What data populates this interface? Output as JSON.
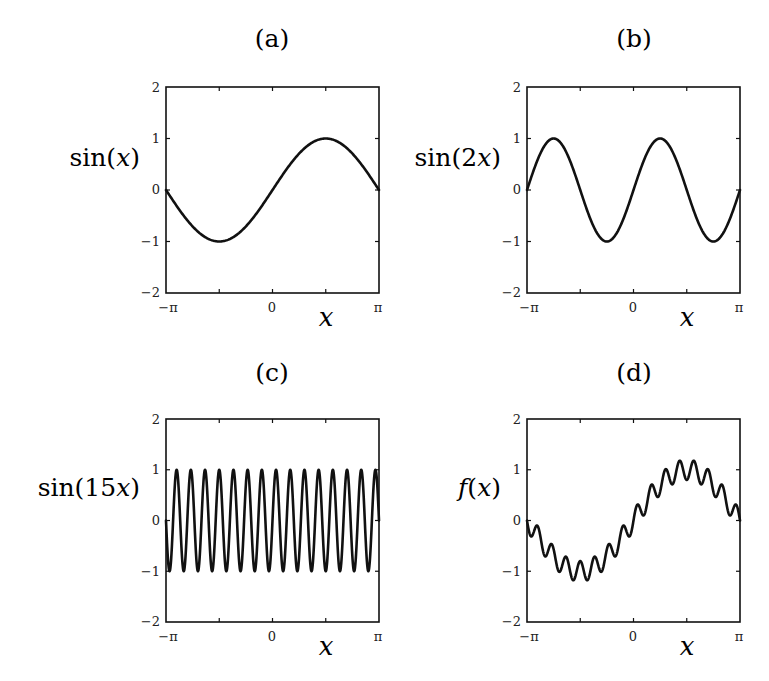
{
  "chart_data": [
    {
      "type": "line",
      "panel": "a",
      "title": "(a)",
      "xlabel": "x",
      "ylabel": "sin(x)",
      "function": "sin(x)",
      "xlim": [
        "-π",
        "π"
      ],
      "ylim": [
        -2,
        2
      ],
      "x_ticks": [
        "−π",
        "0",
        "π"
      ],
      "y_ticks": [
        "2",
        "1",
        "0",
        "−1",
        "−2"
      ],
      "grid": false,
      "samples_x": [
        -3.1416,
        -2.3562,
        -1.5708,
        -0.7854,
        0,
        0.7854,
        1.5708,
        2.3562,
        3.1416
      ],
      "samples_y": [
        0,
        -0.707,
        -1,
        -0.707,
        0,
        0.707,
        1,
        0.707,
        0
      ]
    },
    {
      "type": "line",
      "panel": "b",
      "title": "(b)",
      "xlabel": "x",
      "ylabel": "sin(2x)",
      "function": "sin(2x)",
      "xlim": [
        "-π",
        "π"
      ],
      "ylim": [
        -2,
        2
      ],
      "x_ticks": [
        "−π",
        "0",
        "π"
      ],
      "y_ticks": [
        "2",
        "1",
        "0",
        "−1",
        "−2"
      ],
      "grid": false,
      "samples_x": [
        -3.1416,
        -2.3562,
        -1.5708,
        -0.7854,
        0,
        0.7854,
        1.5708,
        2.3562,
        3.1416
      ],
      "samples_y": [
        0,
        1,
        0,
        -1,
        0,
        1,
        0,
        -1,
        0
      ]
    },
    {
      "type": "line",
      "panel": "c",
      "title": "(c)",
      "xlabel": "x",
      "ylabel": "sin(15x)",
      "function": "sin(15x)",
      "xlim": [
        "-π",
        "π"
      ],
      "ylim": [
        -2,
        2
      ],
      "x_ticks": [
        "−π",
        "0",
        "π"
      ],
      "y_ticks": [
        "2",
        "1",
        "0",
        "−1",
        "−2"
      ],
      "grid": false,
      "periods": 15,
      "amplitude": 1
    },
    {
      "type": "line",
      "panel": "d",
      "title": "(d)",
      "xlabel": "x",
      "ylabel": "f(x)",
      "function": "sin(x) + 0.2·sin(15x) (approx.)",
      "xlim": [
        "-π",
        "π"
      ],
      "ylim": [
        -2,
        2
      ],
      "x_ticks": [
        "−π",
        "0",
        "π"
      ],
      "y_ticks": [
        "2",
        "1",
        "0",
        "−1",
        "−2"
      ],
      "grid": false,
      "approx_max": 1.2,
      "approx_min": -1.2
    }
  ],
  "panels": [
    {
      "id": "a",
      "title": "(a)",
      "ylabel_pre": "sin(",
      "ylabel_var": "x",
      "ylabel_post": ")",
      "xlabel": "x",
      "tick_x_left": "−π",
      "tick_x_mid": "0",
      "tick_x_right": "π",
      "tick_y": [
        "2",
        "1",
        "0",
        "−1",
        "−2"
      ]
    },
    {
      "id": "b",
      "title": "(b)",
      "ylabel_pre": "sin(2",
      "ylabel_var": "x",
      "ylabel_post": ")",
      "xlabel": "x",
      "tick_x_left": "−π",
      "tick_x_mid": "0",
      "tick_x_right": "π",
      "tick_y": [
        "2",
        "1",
        "0",
        "−1",
        "−2"
      ]
    },
    {
      "id": "c",
      "title": "(c)",
      "ylabel_pre": "sin(15",
      "ylabel_var": "x",
      "ylabel_post": ")",
      "xlabel": "x",
      "tick_x_left": "−π",
      "tick_x_mid": "0",
      "tick_x_right": "π",
      "tick_y": [
        "2",
        "1",
        "0",
        "−1",
        "−2"
      ]
    },
    {
      "id": "d",
      "title": "(d)",
      "ylabel_pre": "f(",
      "ylabel_var": "x",
      "ylabel_post": ")",
      "xlabel": "x",
      "tick_x_left": "−π",
      "tick_x_mid": "0",
      "tick_x_right": "π",
      "tick_y": [
        "2",
        "1",
        "0",
        "−1",
        "−2"
      ]
    }
  ],
  "render": {
    "curve_color": "#111111",
    "frame_color": "#111111",
    "background": "#ffffff"
  }
}
